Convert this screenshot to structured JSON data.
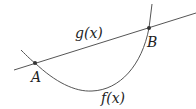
{
  "diagram": {
    "line_label": "g(x)",
    "curve_label": "f(x)",
    "point_a_label": "A",
    "point_b_label": "B",
    "colors": {
      "stroke": "#555555",
      "point": "#333333",
      "text": "#222222",
      "background": "#ffffff"
    }
  }
}
